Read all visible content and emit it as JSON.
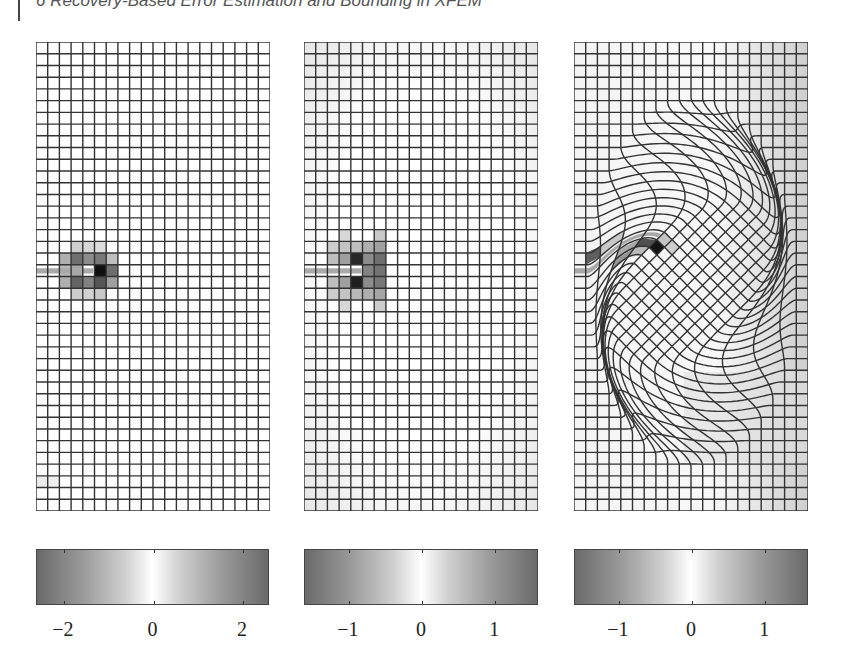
{
  "header": {
    "running_title": "6 Recovery-Based Error Estimation and Bounding in XFEM"
  },
  "figure": {
    "grid": {
      "cols": 20,
      "rows": 40,
      "line_color": "#333333"
    },
    "crack": {
      "row": 19,
      "tip_col": 4.9,
      "color": "#a8a8a8"
    },
    "panels": [
      {
        "id": "panel-1",
        "mesh": "structured",
        "left": 36,
        "shaded_cells": [
          {
            "r": 17,
            "c": 3,
            "g": 205
          },
          {
            "r": 17,
            "c": 4,
            "g": 215
          },
          {
            "r": 17,
            "c": 5,
            "g": 220
          },
          {
            "r": 18,
            "c": 2,
            "g": 175
          },
          {
            "r": 18,
            "c": 3,
            "g": 110
          },
          {
            "r": 18,
            "c": 4,
            "g": 140
          },
          {
            "r": 18,
            "c": 5,
            "g": 120
          },
          {
            "r": 18,
            "c": 6,
            "g": 190
          },
          {
            "r": 19,
            "c": 5,
            "g": 15
          },
          {
            "r": 19,
            "c": 6,
            "g": 110
          },
          {
            "r": 19,
            "c": 2,
            "g": 185
          },
          {
            "r": 19,
            "c": 3,
            "g": 165
          },
          {
            "r": 20,
            "c": 2,
            "g": 175
          },
          {
            "r": 20,
            "c": 3,
            "g": 100
          },
          {
            "r": 20,
            "c": 4,
            "g": 130
          },
          {
            "r": 20,
            "c": 5,
            "g": 85
          },
          {
            "r": 20,
            "c": 6,
            "g": 160
          },
          {
            "r": 21,
            "c": 3,
            "g": 205
          },
          {
            "r": 21,
            "c": 4,
            "g": 210
          },
          {
            "r": 21,
            "c": 5,
            "g": 200
          },
          {
            "r": 37,
            "c": 0,
            "g": 235
          },
          {
            "r": 37,
            "c": 1,
            "g": 238
          }
        ],
        "colorbar": {
          "min": -2.6,
          "max": 2.6,
          "ticks": [
            {
              "value": -2,
              "label": "−2"
            },
            {
              "value": 0,
              "label": "0"
            },
            {
              "value": 2,
              "label": "2"
            }
          ]
        }
      },
      {
        "id": "panel-2",
        "mesh": "structured",
        "left": 304,
        "background_tint": true,
        "shaded_cells": [
          {
            "r": 16,
            "c": 3,
            "g": 215
          },
          {
            "r": 16,
            "c": 6,
            "g": 200
          },
          {
            "r": 17,
            "c": 2,
            "g": 205
          },
          {
            "r": 17,
            "c": 3,
            "g": 195
          },
          {
            "r": 17,
            "c": 4,
            "g": 190
          },
          {
            "r": 17,
            "c": 5,
            "g": 175
          },
          {
            "r": 17,
            "c": 6,
            "g": 160
          },
          {
            "r": 18,
            "c": 2,
            "g": 190
          },
          {
            "r": 18,
            "c": 3,
            "g": 160
          },
          {
            "r": 18,
            "c": 4,
            "g": 40
          },
          {
            "r": 18,
            "c": 5,
            "g": 140
          },
          {
            "r": 18,
            "c": 6,
            "g": 110
          },
          {
            "r": 19,
            "c": 5,
            "g": 130
          },
          {
            "r": 19,
            "c": 6,
            "g": 115
          },
          {
            "r": 20,
            "c": 2,
            "g": 190
          },
          {
            "r": 20,
            "c": 3,
            "g": 160
          },
          {
            "r": 20,
            "c": 4,
            "g": 30
          },
          {
            "r": 20,
            "c": 5,
            "g": 140
          },
          {
            "r": 20,
            "c": 6,
            "g": 120
          },
          {
            "r": 21,
            "c": 2,
            "g": 205
          },
          {
            "r": 21,
            "c": 3,
            "g": 195
          },
          {
            "r": 21,
            "c": 4,
            "g": 185
          },
          {
            "r": 21,
            "c": 5,
            "g": 175
          },
          {
            "r": 21,
            "c": 6,
            "g": 165
          },
          {
            "r": 22,
            "c": 3,
            "g": 215
          },
          {
            "r": 22,
            "c": 6,
            "g": 205
          }
        ],
        "colorbar": {
          "min": -1.6,
          "max": 1.6,
          "ticks": [
            {
              "value": -1,
              "label": "−1"
            },
            {
              "value": 0,
              "label": "0"
            },
            {
              "value": 1,
              "label": "1"
            }
          ]
        }
      },
      {
        "id": "panel-3",
        "mesh": "deformed",
        "left": 574,
        "shaded_cells": [
          {
            "r": 18,
            "c": 1,
            "g": 95
          },
          {
            "r": 18,
            "c": 2,
            "g": 200
          },
          {
            "r": 20,
            "c": 4,
            "g": 80
          },
          {
            "r": 20,
            "c": 5,
            "g": 20
          },
          {
            "r": 20,
            "c": 3,
            "g": 170
          },
          {
            "r": 21,
            "c": 3,
            "g": 150
          },
          {
            "r": 21,
            "c": 4,
            "g": 185
          },
          {
            "r": 19,
            "c": 5,
            "g": 195
          },
          {
            "r": 19,
            "c": 6,
            "g": 205
          }
        ],
        "colorbar": {
          "min": -1.6,
          "max": 1.6,
          "ticks": [
            {
              "value": -1,
              "label": "−1"
            },
            {
              "value": 0,
              "label": "0"
            },
            {
              "value": 1,
              "label": "1"
            }
          ]
        }
      }
    ]
  }
}
